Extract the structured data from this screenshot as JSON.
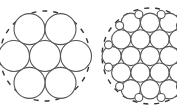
{
  "figures": [
    {
      "name": "seven-circle-packing",
      "description": "7 equal circles in hexagonal packing inside a dashed circle",
      "outer": {
        "cx": 45,
        "cy": 56,
        "r": 45
      },
      "circle_radius": 15.5,
      "count": 7
    },
    {
      "name": "nineteen-circle-packing-with-small-fillers",
      "description": "19 equal circles in hexagonal packing with small circles filling perimeter gaps inside a dashed circle",
      "outer": {
        "cx": 150,
        "cy": 56,
        "r": 48
      },
      "circle_radius": 9.6,
      "count": 19,
      "small_circle_radius": 4,
      "small_count": 12
    }
  ]
}
